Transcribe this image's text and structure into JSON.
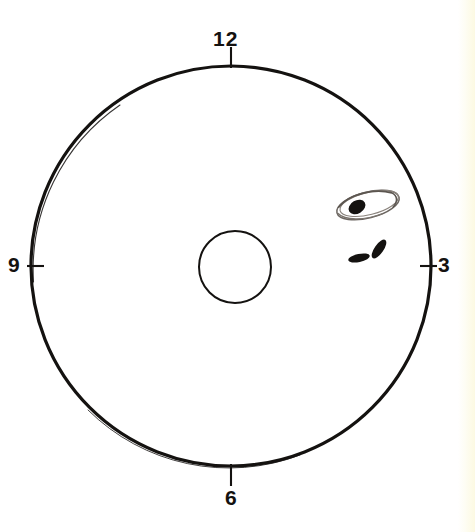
{
  "figure": {
    "type": "retinal-fundus-clock-chart",
    "background_color": "#ffffff",
    "ink_color": "#141210",
    "sketch_color": "#6b6560",
    "page_edge_color": "#fcf9e2"
  },
  "clock_labels": {
    "top": "12",
    "right": "3",
    "bottom": "6",
    "left": "9"
  },
  "outer_circle": {
    "name": "retina-boundary",
    "cx": 231,
    "cy": 266,
    "r": 200,
    "stroke_width": 3.2,
    "stroke": "#141210",
    "fill": "none"
  },
  "inner_circle": {
    "name": "optic-disc",
    "cx": 235,
    "cy": 267,
    "r": 36,
    "stroke_width": 2.0,
    "stroke": "#141210",
    "fill": "none"
  },
  "tick_marks": [
    {
      "name": "tick-12",
      "x1": 231,
      "y1": 47,
      "x2": 231,
      "y2": 68,
      "orientation": "vertical"
    },
    {
      "name": "tick-3",
      "x1": 420,
      "y1": 266,
      "x2": 437,
      "y2": 266,
      "orientation": "horizontal"
    },
    {
      "name": "tick-6",
      "x1": 231,
      "y1": 464,
      "x2": 231,
      "y2": 486,
      "orientation": "vertical"
    },
    {
      "name": "tick-9",
      "x1": 27,
      "y1": 266,
      "x2": 44,
      "y2": 266,
      "orientation": "horizontal"
    }
  ],
  "lesions": [
    {
      "name": "retinal-tear-outline",
      "shape": "sketchy-ellipse",
      "cx": 368,
      "cy": 205,
      "rx": 32,
      "ry": 13,
      "rotation_deg": -14,
      "stroke": "#6b6560",
      "quadrant": "upper-right"
    },
    {
      "name": "lesion-blob-primary",
      "shape": "filled-oval",
      "cx": 357,
      "cy": 207,
      "rx": 9,
      "ry": 6.5,
      "rotation_deg": -30,
      "fill": "#141210"
    },
    {
      "name": "hemorrhage-mark-left",
      "shape": "filled-oval",
      "cx": 359,
      "cy": 258,
      "rx": 11,
      "ry": 4,
      "rotation_deg": -12,
      "fill": "#141210"
    },
    {
      "name": "hemorrhage-mark-right",
      "shape": "filled-oval",
      "cx": 379,
      "cy": 249,
      "rx": 11,
      "ry": 4.5,
      "rotation_deg": -55,
      "fill": "#141210"
    }
  ]
}
